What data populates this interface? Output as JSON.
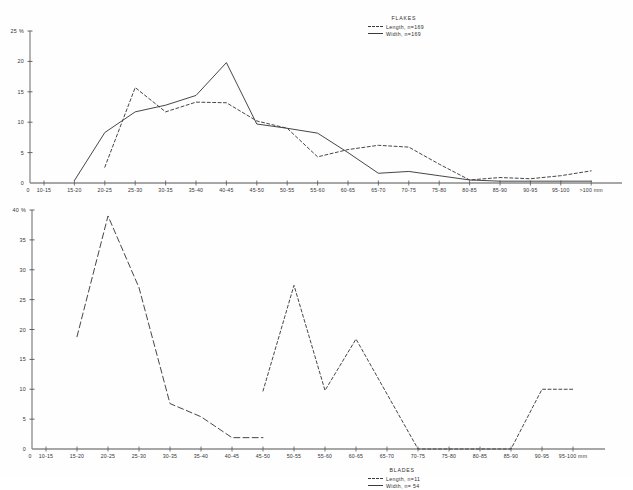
{
  "chart_data": [
    {
      "type": "line",
      "title": "FLAKES",
      "xlabel": "",
      "ylabel": "%",
      "ylim": [
        0,
        25
      ],
      "yticks": [
        0,
        5,
        10,
        15,
        20,
        25
      ],
      "ytick_labels": [
        "0",
        "5",
        "10",
        "15",
        "20",
        "25 %"
      ],
      "grid": false,
      "legend_position": "top-right",
      "categories": [
        "10-15",
        "15-20",
        "20-25",
        "25-30",
        "30-35",
        "35-40",
        "40-45",
        "45-50",
        "50-55",
        "55-60",
        "60-65",
        "65-70",
        "70-75",
        "75-80",
        "80-85",
        "85-90",
        "90-95",
        "95-100",
        ">100 mm"
      ],
      "origin_label": "0",
      "series": [
        {
          "name": "Length, n=169",
          "style": "dashed",
          "values": [
            null,
            null,
            2.6,
            15.7,
            11.7,
            13.3,
            13.2,
            10.2,
            9.0,
            4.3,
            5.5,
            6.2,
            5.9,
            3.1,
            0.5,
            0.9,
            0.7,
            1.2,
            2.0
          ]
        },
        {
          "name": "Width, n=169",
          "style": "solid",
          "values": [
            null,
            0.4,
            8.3,
            11.7,
            12.8,
            14.4,
            19.8,
            9.7,
            9.0,
            8.2,
            5.0,
            1.6,
            1.9,
            1.2,
            0.5,
            0.3,
            0.3,
            0.3,
            0.3
          ]
        }
      ]
    },
    {
      "type": "line",
      "title": "BLADES",
      "xlabel": "",
      "ylabel": "%",
      "ylim": [
        0,
        40
      ],
      "yticks": [
        0,
        5,
        10,
        15,
        20,
        25,
        30,
        35,
        40
      ],
      "ytick_labels": [
        "0",
        "5",
        "10",
        "15",
        "20",
        "25",
        "30",
        "35",
        "40 %"
      ],
      "grid": false,
      "legend_position": "top-right",
      "categories": [
        "10-15",
        "15-20",
        "20-25",
        "25-30",
        "30-35",
        "35-40",
        "40-45",
        "45-50",
        "50-55",
        "55-60",
        "60-65",
        "65-70",
        "70-75",
        "75-80",
        "80-85",
        "85-90",
        "90-95",
        "95-100 mm"
      ],
      "origin_label": "0",
      "series": [
        {
          "name": "Length, n=11",
          "style": "dashed",
          "values": [
            null,
            null,
            null,
            null,
            null,
            null,
            null,
            9.7,
            27.4,
            9.8,
            18.4,
            9.2,
            0.0,
            0.0,
            0.0,
            0.0,
            10.0,
            10.0
          ]
        },
        {
          "name": "Width, n=54",
          "style": "dashed-long",
          "values": [
            null,
            18.8,
            39.0,
            27.0,
            7.6,
            5.4,
            1.9,
            1.9,
            null,
            null,
            null,
            null,
            null,
            null,
            null,
            null,
            null,
            null
          ]
        }
      ]
    }
  ],
  "flakes": {
    "legend": {
      "title": "FLAKES",
      "entries": [
        {
          "label": "Length, n=169",
          "style": "dashed"
        },
        {
          "label": "Width, n=169",
          "style": "solid"
        }
      ]
    }
  },
  "blades": {
    "legend": {
      "title": "BLADES",
      "entries": [
        {
          "label": "Length, n=11",
          "style": "dashed"
        },
        {
          "label": "Width, n= 54",
          "style": "solid"
        }
      ]
    }
  }
}
